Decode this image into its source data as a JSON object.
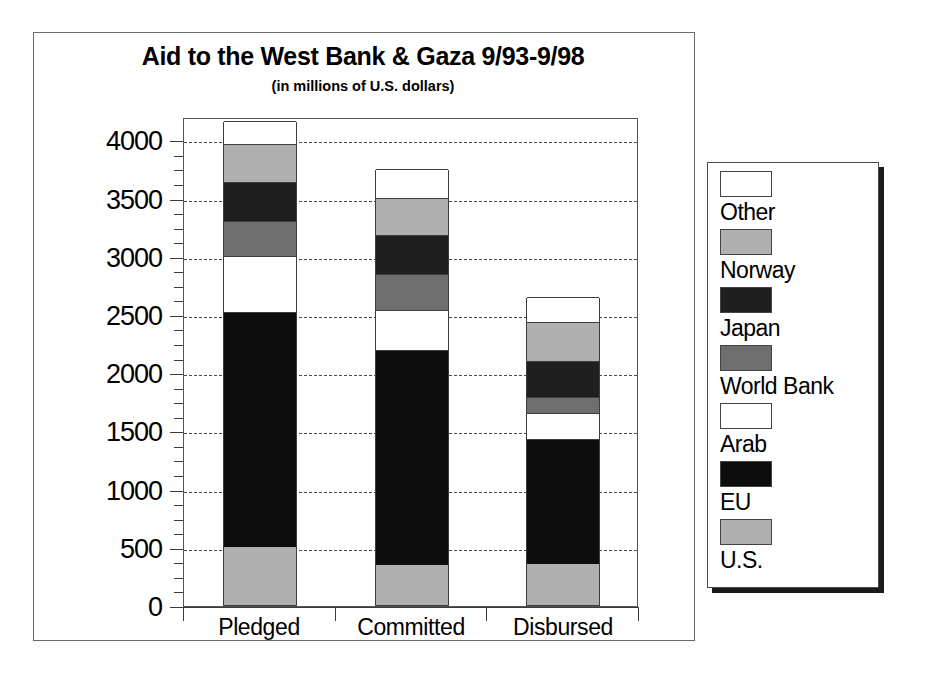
{
  "chart_data": {
    "type": "bar",
    "stacked": true,
    "title": "Aid to the West Bank & Gaza 9/93-9/98",
    "subtitle": "(in millions of U.S. dollars)",
    "xlabel": "",
    "ylabel": "",
    "ylim": [
      0,
      4200
    ],
    "yticks": [
      0,
      500,
      1000,
      1500,
      2000,
      2500,
      3000,
      3500,
      4000
    ],
    "ytick_labels": [
      "0",
      "500",
      "1000",
      "1500",
      "2000",
      "2500",
      "3000",
      "3500",
      "4000"
    ],
    "minor_tick_step": 125,
    "grid": true,
    "grid_style": "dashed",
    "legend_position": "right",
    "categories": [
      "Pledged",
      "Committed",
      "Disbursed"
    ],
    "series": [
      {
        "name": "U.S.",
        "color": "#b0b0b0",
        "values": [
          500,
          345,
          353
        ]
      },
      {
        "name": "EU",
        "color": "#0d0d0d",
        "values": [
          2020,
          1845,
          1072
        ]
      },
      {
        "name": "Arab",
        "color": "#ffffff",
        "values": [
          480,
          340,
          225
        ]
      },
      {
        "name": "World Bank",
        "color": "#6e6e6e",
        "values": [
          300,
          310,
          140
        ]
      },
      {
        "name": "Japan",
        "color": "#1f1f1f",
        "values": [
          330,
          335,
          310
        ]
      },
      {
        "name": "Norway",
        "color": "#b0b0b0",
        "values": [
          330,
          325,
          330
        ]
      },
      {
        "name": "Other",
        "color": "#ffffff",
        "values": [
          200,
          245,
          215
        ]
      }
    ],
    "totals": [
      4160,
      3745,
      2645
    ],
    "legend_entries": [
      {
        "label": "Other",
        "color": "#ffffff"
      },
      {
        "label": "Norway",
        "color": "#b0b0b0"
      },
      {
        "label": "Japan",
        "color": "#1f1f1f"
      },
      {
        "label": "World Bank",
        "color": "#6e6e6e"
      },
      {
        "label": "Arab",
        "color": "#ffffff"
      },
      {
        "label": "EU",
        "color": "#0d0d0d"
      },
      {
        "label": "U.S.",
        "color": "#b0b0b0"
      }
    ]
  }
}
